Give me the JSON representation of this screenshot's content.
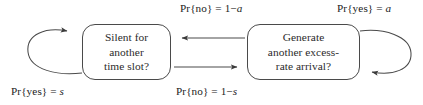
{
  "diagram": {
    "type": "state-transition-diagram",
    "background_color": "#ffffff",
    "stroke_color": "#4a4a4a",
    "text_color": "#262626",
    "states": [
      {
        "id": "silent",
        "lines": [
          "Silent for",
          "another",
          "time slot?"
        ]
      },
      {
        "id": "generate",
        "lines": [
          "Generate",
          "another excess-",
          "rate arrival?"
        ]
      }
    ],
    "labels": {
      "top_center": {
        "prefix": "Pr{no} = 1−",
        "symbol": "a",
        "full": "Pr{no} = 1−a"
      },
      "top_right": {
        "prefix": "Pr{yes} = ",
        "symbol": "a",
        "full": "Pr{yes} = a"
      },
      "bottom_left": {
        "prefix": "Pr{yes} = ",
        "symbol": "s",
        "full": "Pr{yes} = s"
      },
      "bottom_center": {
        "prefix": "Pr{no} = 1−",
        "symbol": "s",
        "full": "Pr{no} = 1−s"
      }
    },
    "edges": [
      {
        "id": "self-loop-silent",
        "from": "silent",
        "to": "silent",
        "direction": "left-loop",
        "label": "Pr{yes} = s"
      },
      {
        "id": "self-loop-generate",
        "from": "generate",
        "to": "generate",
        "direction": "right-loop",
        "label": "Pr{yes} = a"
      },
      {
        "id": "generate-to-silent",
        "from": "generate",
        "to": "silent",
        "direction": "left",
        "label": "Pr{no} = 1−a"
      },
      {
        "id": "silent-to-generate",
        "from": "silent",
        "to": "generate",
        "direction": "right",
        "label": "Pr{no} = 1−s"
      }
    ]
  }
}
